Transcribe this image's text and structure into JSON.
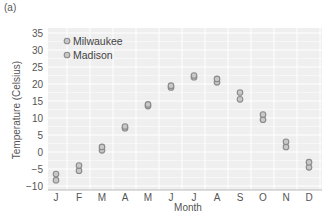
{
  "panel_label": "(a)",
  "chart_data": {
    "type": "scatter",
    "title": "",
    "xlabel": "Month",
    "ylabel": "Temperature (Celsius)",
    "categories": [
      "J",
      "F",
      "M",
      "A",
      "M",
      "J",
      "J",
      "A",
      "S",
      "O",
      "N",
      "D"
    ],
    "ylim": [
      -10,
      35
    ],
    "yticks": [
      -10,
      -5,
      0,
      5,
      10,
      15,
      20,
      25,
      30,
      35
    ],
    "grid": true,
    "legend_position": "upper-left",
    "series": [
      {
        "name": "Milwaukee",
        "values": [
          -8.3,
          -5.5,
          0.5,
          7.0,
          13.5,
          19.0,
          22.0,
          20.5,
          15.5,
          9.5,
          1.5,
          -4.5
        ]
      },
      {
        "name": "Madison",
        "values": [
          -6.5,
          -4.0,
          1.5,
          7.5,
          14.0,
          19.5,
          22.5,
          21.5,
          17.5,
          11.0,
          3.0,
          -3.0
        ]
      }
    ]
  },
  "colors": {
    "plot_background": "#efefef",
    "grid": "#ffffff",
    "marker_fill": "#c8c8c8",
    "marker_stroke": "#8a8a8a",
    "text": "#555555"
  }
}
